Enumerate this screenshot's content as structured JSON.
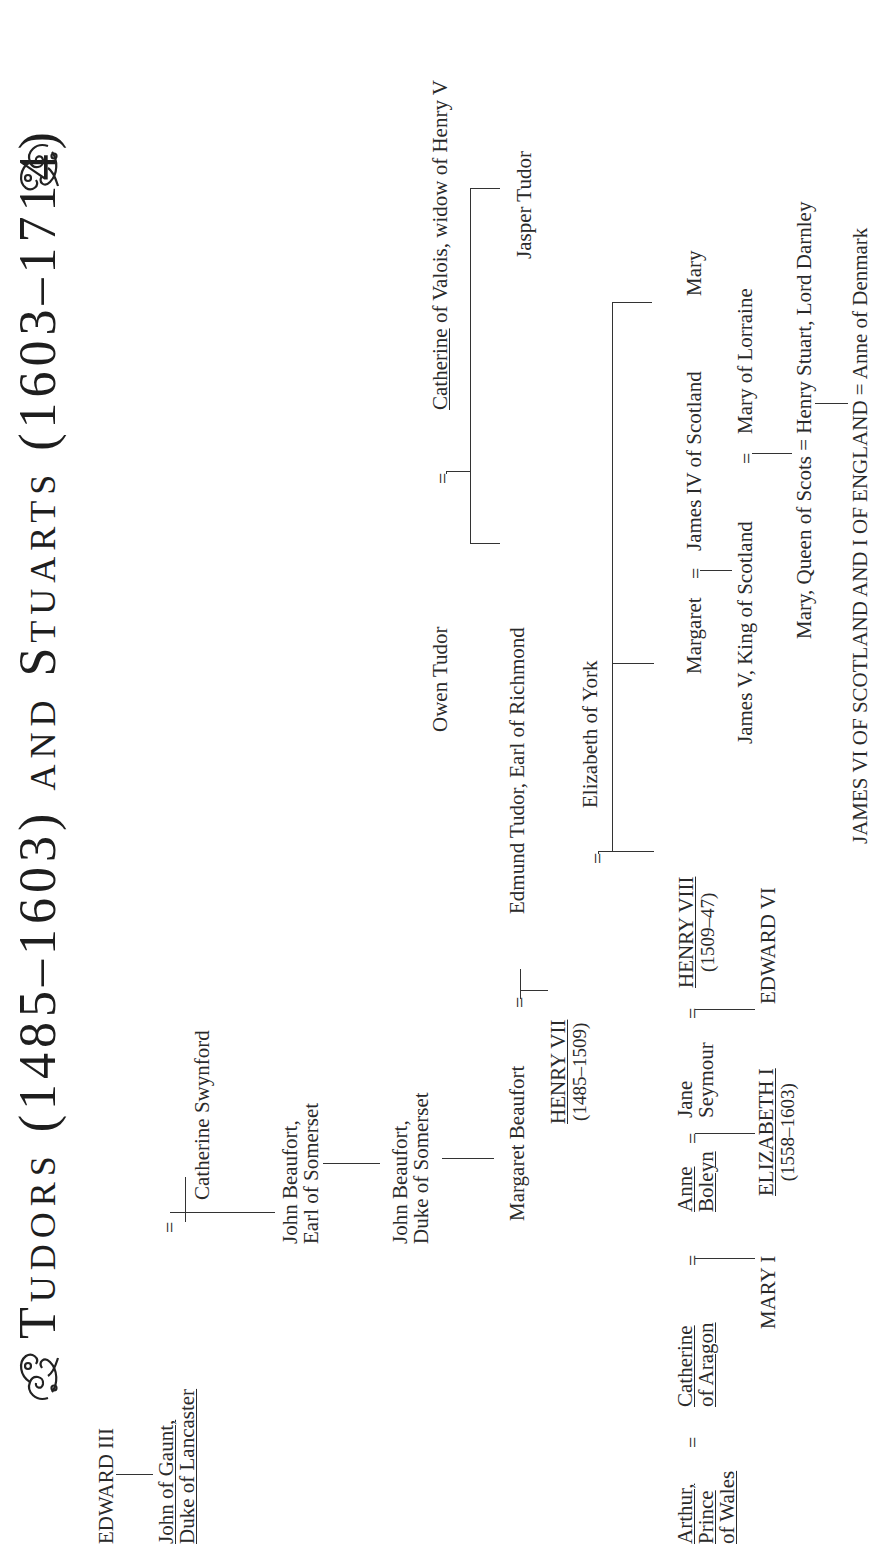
{
  "title": {
    "part1_initial": "T",
    "part1_rest": "UDORS",
    "part1_dates": "(1485–1603)",
    "and": "AND",
    "part2_initial": "S",
    "part2_rest": "TUARTS",
    "part2_dates": "(1603–1714)",
    "ornament_left": "ornament",
    "ornament_right": "ornament"
  },
  "people": {
    "edward_iii": "EDWARD III",
    "john_of_gaunt_1": "John of Gaunt,",
    "john_of_gaunt_2": "Duke of Lancaster",
    "catherine_swynford": "Catherine Swynford",
    "john_beaufort_earl_1": "John Beaufort,",
    "john_beaufort_earl_2": "Earl of Somerset",
    "john_beaufort_duke_1": "John Beaufort,",
    "john_beaufort_duke_2": "Duke of Somerset",
    "margaret_beaufort": "Margaret Beaufort",
    "owen_tudor": "Owen Tudor",
    "catherine_of_valois_name": "Catherine",
    "catherine_of_valois_rest": " of Valois, widow of Henry V",
    "edmund_tudor": "Edmund Tudor, Earl of Richmond",
    "jasper_tudor": "Jasper Tudor",
    "henry_vii": "HENRY VII",
    "henry_vii_dates": "(1485–1509)",
    "elizabeth_of_york": "Elizabeth of York",
    "arthur_1": "Arthur,",
    "arthur_2": "Prince",
    "arthur_3": "of Wales",
    "catherine_of_aragon_1": "Catherine",
    "catherine_of_aragon_2": "of Aragon",
    "anne_boleyn_1": "Anne",
    "anne_boleyn_2": "Boleyn",
    "jane_seymour_1": "Jane",
    "jane_seymour_2": "Seymour",
    "henry_viii": "HENRY VIII",
    "henry_viii_dates": "(1509–47)",
    "margaret": "Margaret",
    "james_iv": "James IV of Scotland",
    "mary": "Mary",
    "mary_i": "MARY I",
    "elizabeth_i": "ELIZABETH I",
    "elizabeth_i_dates": "(1558–1603)",
    "edward_vi": "EDWARD VI",
    "james_v": "James V, King of Scotland",
    "mary_of_lorraine": "Mary of Lorraine",
    "mary_queen_of_scots": "Mary, Queen of Scots",
    "henry_stuart": "Henry Stuart, Lord Darnley",
    "james_vi_i": "JAMES VI OF SCOTLAND AND I OF ENGLAND",
    "anne_of_denmark": "Anne of Denmark"
  },
  "symbols": {
    "marriage": "="
  },
  "colors": {
    "text": "#2a2a2a",
    "lines": "#333333",
    "background": "#ffffff"
  }
}
